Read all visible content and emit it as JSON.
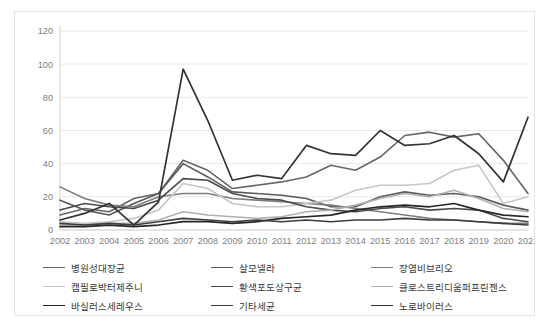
{
  "chart_data": {
    "type": "line",
    "title": "",
    "xlabel": "",
    "ylabel": "",
    "ylim": [
      0,
      120
    ],
    "ytick_step": 20,
    "ytick_labels": [
      "0",
      "20",
      "40",
      "60",
      "80",
      "100",
      "120"
    ],
    "grid": true,
    "legend_position": "bottom",
    "legend_columns": 3,
    "categories": [
      "2002",
      "2003",
      "2004",
      "2005",
      "2006",
      "2007",
      "2008",
      "2009",
      "2010",
      "2011",
      "2012",
      "2013",
      "2014",
      "2015",
      "2016",
      "2017",
      "2018",
      "2019",
      "2020",
      "2021"
    ],
    "series": [
      {
        "name": "병원성대장균",
        "color": "#666666",
        "width": 1.6,
        "values": [
          9,
          13,
          11,
          19,
          22,
          42,
          36,
          25,
          27,
          29,
          32,
          39,
          36,
          44,
          57,
          59,
          56,
          58,
          42,
          22
        ]
      },
      {
        "name": "살모넬라",
        "color": "#5a5a5a",
        "width": 1.6,
        "values": [
          18,
          12,
          9,
          16,
          22,
          40,
          32,
          23,
          22,
          21,
          19,
          14,
          14,
          20,
          23,
          21,
          22,
          20,
          15,
          12
        ]
      },
      {
        "name": "장염비브리오",
        "color": "#7d7d7d",
        "width": 1.6,
        "values": [
          26,
          19,
          15,
          14,
          20,
          22,
          22,
          19,
          18,
          17,
          16,
          15,
          13,
          11,
          9,
          7,
          6,
          5,
          4,
          4
        ]
      },
      {
        "name": "캠필로박터제주니",
        "color": "#c6c6c6",
        "width": 1.6,
        "values": [
          5,
          4,
          5,
          7,
          12,
          28,
          25,
          16,
          14,
          14,
          16,
          18,
          24,
          27,
          27,
          28,
          36,
          39,
          16,
          20
        ]
      },
      {
        "name": "황색포도상구균",
        "color": "#4a4a4a",
        "width": 1.6,
        "values": [
          12,
          16,
          14,
          13,
          18,
          31,
          30,
          22,
          19,
          18,
          14,
          12,
          11,
          13,
          14,
          12,
          13,
          12,
          7,
          5
        ]
      },
      {
        "name": "클로스트리디움퍼프린젠스",
        "color": "#b0b0b0",
        "width": 1.6,
        "values": [
          3,
          3,
          4,
          4,
          6,
          11,
          9,
          8,
          7,
          8,
          11,
          12,
          15,
          19,
          22,
          20,
          24,
          19,
          13,
          11
        ]
      },
      {
        "name": "바실러스세레우스",
        "color": "#262626",
        "width": 1.7,
        "values": [
          2,
          2,
          3,
          2,
          3,
          5,
          5,
          4,
          5,
          7,
          8,
          9,
          12,
          14,
          15,
          14,
          16,
          12,
          9,
          8
        ]
      },
      {
        "name": "기타세균",
        "color": "#3d3d3d",
        "width": 1.6,
        "values": [
          4,
          3,
          4,
          3,
          5,
          7,
          6,
          5,
          6,
          5,
          6,
          5,
          6,
          6,
          7,
          6,
          6,
          5,
          4,
          3
        ]
      },
      {
        "name": "노로바이러스",
        "color": "#333333",
        "width": 1.7,
        "values": [
          6,
          10,
          16,
          3,
          17,
          97,
          66,
          30,
          33,
          31,
          51,
          46,
          45,
          60,
          51,
          52,
          57,
          46,
          29,
          68
        ]
      }
    ]
  },
  "legend": {
    "items": [
      {
        "label": "병원성대장균"
      },
      {
        "label": "살모넬라"
      },
      {
        "label": "장염비브리오"
      },
      {
        "label": "캠필로박터제주니"
      },
      {
        "label": "황색포도상구균"
      },
      {
        "label": "클로스트리디움퍼프린젠스"
      },
      {
        "label": "바실러스세레우스"
      },
      {
        "label": "기타세균"
      },
      {
        "label": "노로바이러스"
      }
    ]
  }
}
